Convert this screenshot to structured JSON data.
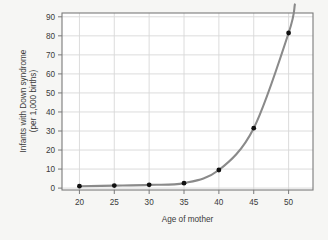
{
  "chart_data": {
    "type": "scatter",
    "title": "",
    "xlabel": "Age of mother",
    "ylabel_line1": "Infants with Down syndrome",
    "ylabel_line2": "(per 1,000 births)",
    "x": [
      20,
      25,
      30,
      35,
      40,
      45,
      50
    ],
    "values": [
      1,
      1.3,
      1.7,
      2.6,
      9.5,
      31.5,
      81.5
    ],
    "series": [
      {
        "name": "Infants with Down syndrome (per 1,000 births)",
        "values": [
          1,
          1.3,
          1.7,
          2.6,
          9.5,
          31.5,
          81.5
        ]
      }
    ],
    "xlim": [
      17.5,
      53.5
    ],
    "ylim": [
      -1,
      92
    ],
    "xticks": [
      20,
      25,
      30,
      35,
      40,
      45,
      50
    ],
    "yticks": [
      0,
      10,
      20,
      30,
      40,
      50,
      60,
      70,
      80,
      90
    ],
    "xtick_labels": [
      "20",
      "25",
      "30",
      "35",
      "40",
      "45",
      "50"
    ],
    "ytick_labels": [
      "0",
      "10",
      "20",
      "30",
      "40",
      "50",
      "60",
      "70",
      "80",
      "90"
    ],
    "grid": true,
    "legend": false,
    "fit_curve": true,
    "marker_color": "#111111",
    "line_color": "#8a8a8a",
    "grid_color": "#d8d8d8",
    "frame_color": "#7a7a7a",
    "plot_background": "#ffffff",
    "page_background": "#f6f6f4"
  }
}
